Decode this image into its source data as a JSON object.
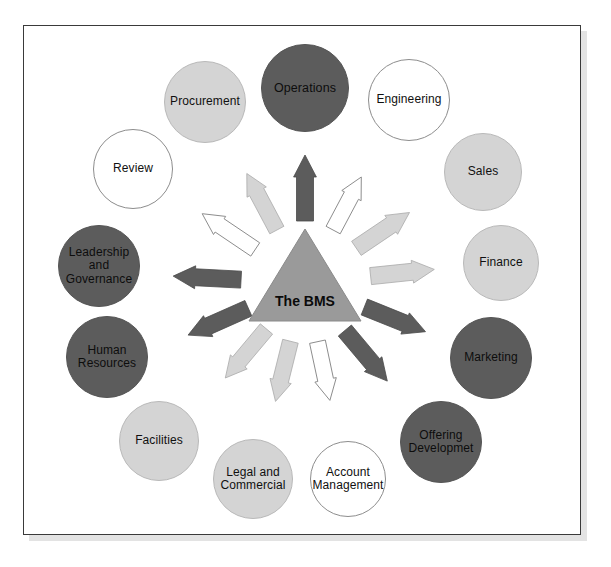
{
  "diagram": {
    "title": "The BMS",
    "hub": {
      "label": "The BMS",
      "shape": "triangle",
      "color": "#9a9a9a"
    },
    "palette": {
      "dark": "#5c5c5c",
      "light": "#d4d4d4",
      "white": "#ffffff",
      "outline": "#8d8d8d",
      "frame_border": "#3a3a3a",
      "frame_shadow": "#e3e3e3",
      "background": "#ffffff",
      "text": "#101010"
    },
    "nodes": [
      {
        "id": "operations",
        "label": "Operations",
        "lines": [
          "Operations"
        ],
        "tone": "dark",
        "cx": 305,
        "cy": 88,
        "r": 44,
        "font": 12.5
      },
      {
        "id": "engineering",
        "label": "Engineering",
        "lines": [
          "Engineering"
        ],
        "tone": "white",
        "cx": 409,
        "cy": 100,
        "r": 41,
        "font": 12
      },
      {
        "id": "sales",
        "label": "Sales",
        "lines": [
          "Sales"
        ],
        "tone": "light",
        "cx": 483,
        "cy": 172,
        "r": 39,
        "font": 12
      },
      {
        "id": "finance",
        "label": "Finance",
        "lines": [
          "Finance"
        ],
        "tone": "light",
        "cx": 501,
        "cy": 263,
        "r": 38,
        "font": 12
      },
      {
        "id": "marketing",
        "label": "Marketing",
        "lines": [
          "Marketing"
        ],
        "tone": "dark",
        "cx": 491,
        "cy": 358,
        "r": 41,
        "font": 12
      },
      {
        "id": "offering-development",
        "label": "Offering Developmet",
        "lines": [
          "Offering",
          "Developmet"
        ],
        "tone": "dark",
        "cx": 441,
        "cy": 442,
        "r": 41,
        "font": 12
      },
      {
        "id": "account-management",
        "label": "Account Management",
        "lines": [
          "Account",
          "Management"
        ],
        "tone": "white",
        "cx": 348,
        "cy": 479,
        "r": 38,
        "font": 12
      },
      {
        "id": "legal-and-commercial",
        "label": "Legal and Commercial",
        "lines": [
          "Legal and",
          "Commercial"
        ],
        "tone": "light",
        "cx": 253,
        "cy": 479,
        "r": 40,
        "font": 12
      },
      {
        "id": "facilities",
        "label": "Facilities",
        "lines": [
          "Facilities"
        ],
        "tone": "light",
        "cx": 159,
        "cy": 441,
        "r": 40,
        "font": 12
      },
      {
        "id": "human-resources",
        "label": "Human Resources",
        "lines": [
          "Human",
          "Resources"
        ],
        "tone": "dark",
        "cx": 107,
        "cy": 357,
        "r": 41,
        "font": 12
      },
      {
        "id": "leadership-and-governance",
        "label": "Leadership and Governance",
        "lines": [
          "Leadership",
          "and",
          "Governance"
        ],
        "tone": "dark",
        "cx": 99,
        "cy": 266,
        "r": 41,
        "font": 12
      },
      {
        "id": "review",
        "label": "Review",
        "lines": [
          "Review"
        ],
        "tone": "white",
        "cx": 133,
        "cy": 169,
        "r": 40,
        "font": 12
      },
      {
        "id": "procurement",
        "label": "Procurement",
        "lines": [
          "Procurement"
        ],
        "tone": "light",
        "cx": 205,
        "cy": 102,
        "r": 41,
        "font": 12
      }
    ],
    "arrows": [
      {
        "id": "arrow-to-operations",
        "target": "operations",
        "tone": "dark",
        "angle": -90,
        "inner": 62,
        "outer": 128,
        "w": 17,
        "head": 22
      },
      {
        "id": "arrow-to-engineering",
        "target": "engineering",
        "tone": "white",
        "angle": -62,
        "inner": 60,
        "outer": 120,
        "w": 16,
        "head": 21
      },
      {
        "id": "arrow-to-sales",
        "target": "sales",
        "tone": "light",
        "angle": -34,
        "inner": 62,
        "outer": 126,
        "w": 17,
        "head": 22
      },
      {
        "id": "arrow-to-finance",
        "target": "finance",
        "tone": "light",
        "angle": -6,
        "inner": 66,
        "outer": 130,
        "w": 17,
        "head": 22
      },
      {
        "id": "arrow-to-marketing",
        "target": "marketing",
        "tone": "dark",
        "angle": 22,
        "inner": 64,
        "outer": 130,
        "w": 17,
        "head": 22
      },
      {
        "id": "arrow-to-offering-development",
        "target": "offering-development",
        "tone": "dark",
        "angle": 50,
        "inner": 62,
        "outer": 128,
        "w": 17,
        "head": 22
      },
      {
        "id": "arrow-to-account-management",
        "target": "account-management",
        "tone": "white",
        "angle": 78,
        "inner": 60,
        "outer": 120,
        "w": 16,
        "head": 21
      },
      {
        "id": "arrow-to-legal-and-commercial",
        "target": "legal-and-commercial",
        "tone": "light",
        "angle": 104,
        "inner": 60,
        "outer": 122,
        "w": 16,
        "head": 21
      },
      {
        "id": "arrow-to-facilities",
        "target": "facilities",
        "tone": "light",
        "angle": 130,
        "inner": 60,
        "outer": 124,
        "w": 16,
        "head": 21
      },
      {
        "id": "arrow-to-human-resources",
        "target": "human-resources",
        "tone": "dark",
        "angle": 156,
        "inner": 62,
        "outer": 128,
        "w": 17,
        "head": 22
      },
      {
        "id": "arrow-to-leadership",
        "target": "leadership-and-governance",
        "tone": "dark",
        "angle": 183,
        "inner": 64,
        "outer": 132,
        "w": 17,
        "head": 22
      },
      {
        "id": "arrow-to-review",
        "target": "review",
        "tone": "white",
        "angle": 214,
        "inner": 60,
        "outer": 124,
        "w": 16,
        "head": 21
      },
      {
        "id": "arrow-to-procurement",
        "target": "procurement",
        "tone": "light",
        "angle": 242,
        "inner": 60,
        "outer": 124,
        "w": 16,
        "head": 21
      }
    ],
    "center": {
      "x": 305,
      "y": 283
    }
  }
}
